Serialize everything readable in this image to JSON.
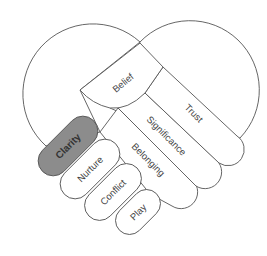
{
  "diagram": {
    "type": "handshake-heart",
    "colors": {
      "outline": "#555555",
      "highlight_fill": "#8c8c8c",
      "default_fill": "#ffffff"
    },
    "right_hand": {
      "thumb": "Belief",
      "fingers": [
        "Trust",
        "Significance",
        "Belonging"
      ]
    },
    "left_hand": {
      "fingers": [
        "Clarity",
        "Nurture",
        "Conflict",
        "Play"
      ],
      "highlighted": "Clarity"
    },
    "labels": {
      "belief": "Belief",
      "trust": "Trust",
      "significance": "Significance",
      "belonging": "Belonging",
      "clarity": "Clarity",
      "nurture": "Nurture",
      "conflict": "Conflict",
      "play": "Play"
    }
  }
}
